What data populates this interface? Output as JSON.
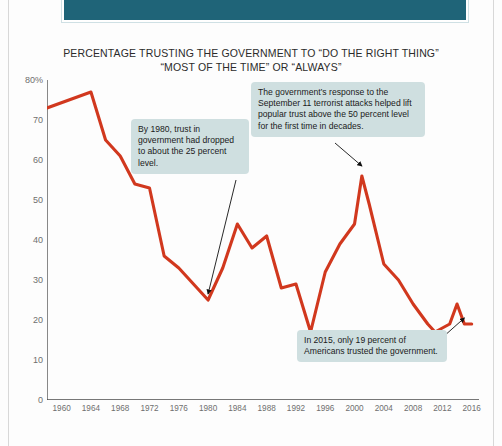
{
  "banner": {
    "text": ""
  },
  "chart_title": {
    "line1": "PERCENTAGE TRUSTING THE GOVERNMENT TO “DO THE RIGHT THING”",
    "line2": "“MOST OF THE TIME” OR “ALWAYS”"
  },
  "colors": {
    "line": "#d1381e",
    "note_bg": "#cfdfe0",
    "banner": "#1f6478",
    "axis": "#4a4a4a",
    "tick_text": "#6f6f6f"
  },
  "annotations": [
    {
      "id": "note-1980",
      "text": "By 1980, trust in government had dropped to about the 25 percent level.",
      "target_year": 1980,
      "target_value": 25
    },
    {
      "id": "note-911",
      "text": "The government’s response to the September 11 terrorist attacks helped lift popular trust above the 50 percent level for the first time in decades.",
      "target_year": 2001,
      "target_value": 56
    },
    {
      "id": "note-2015",
      "text": "In 2015, only 19 percent of Americans trusted the government.",
      "target_year": 2015,
      "target_value": 19
    }
  ],
  "chart_data": {
    "type": "line",
    "title": "PERCENTAGE TRUSTING THE GOVERNMENT TO “DO THE RIGHT THING” “MOST OF THE TIME” OR “ALWAYS”",
    "xlabel": "",
    "ylabel": "",
    "xlim": [
      1958,
      2017
    ],
    "ylim": [
      0,
      80
    ],
    "grid": false,
    "legend": "none",
    "ytick_labels": [
      "0",
      "10",
      "20",
      "30",
      "40",
      "50",
      "60",
      "70",
      "80%"
    ],
    "yticks": [
      0,
      10,
      20,
      30,
      40,
      50,
      60,
      70,
      80
    ],
    "xticks": [
      1960,
      1964,
      1968,
      1972,
      1976,
      1980,
      1984,
      1988,
      1992,
      1996,
      2000,
      2004,
      2008,
      2012,
      2016
    ],
    "xtick_labels": [
      "1960",
      "1964",
      "1968",
      "1972",
      "1976",
      "1980",
      "1984",
      "1988",
      "1992",
      "1996",
      "2000",
      "2004",
      "2008",
      "2012",
      "2016"
    ],
    "series": [
      {
        "name": "Trust in government",
        "color": "#d1381e",
        "x": [
          1958,
          1964,
          1966,
          1968,
          1970,
          1972,
          1974,
          1976,
          1978,
          1980,
          1982,
          1984,
          1986,
          1988,
          1990,
          1992,
          1994,
          1996,
          1998,
          2000,
          2001,
          2002,
          2004,
          2006,
          2008,
          2010,
          2011,
          2013,
          2014,
          2015,
          2016
        ],
        "y": [
          73,
          77,
          65,
          61,
          54,
          53,
          36,
          33,
          29,
          25,
          33,
          44,
          38,
          41,
          28,
          29,
          17,
          32,
          39,
          44,
          56,
          49,
          34,
          30,
          24,
          19,
          17,
          19,
          24,
          19,
          19
        ]
      }
    ]
  }
}
